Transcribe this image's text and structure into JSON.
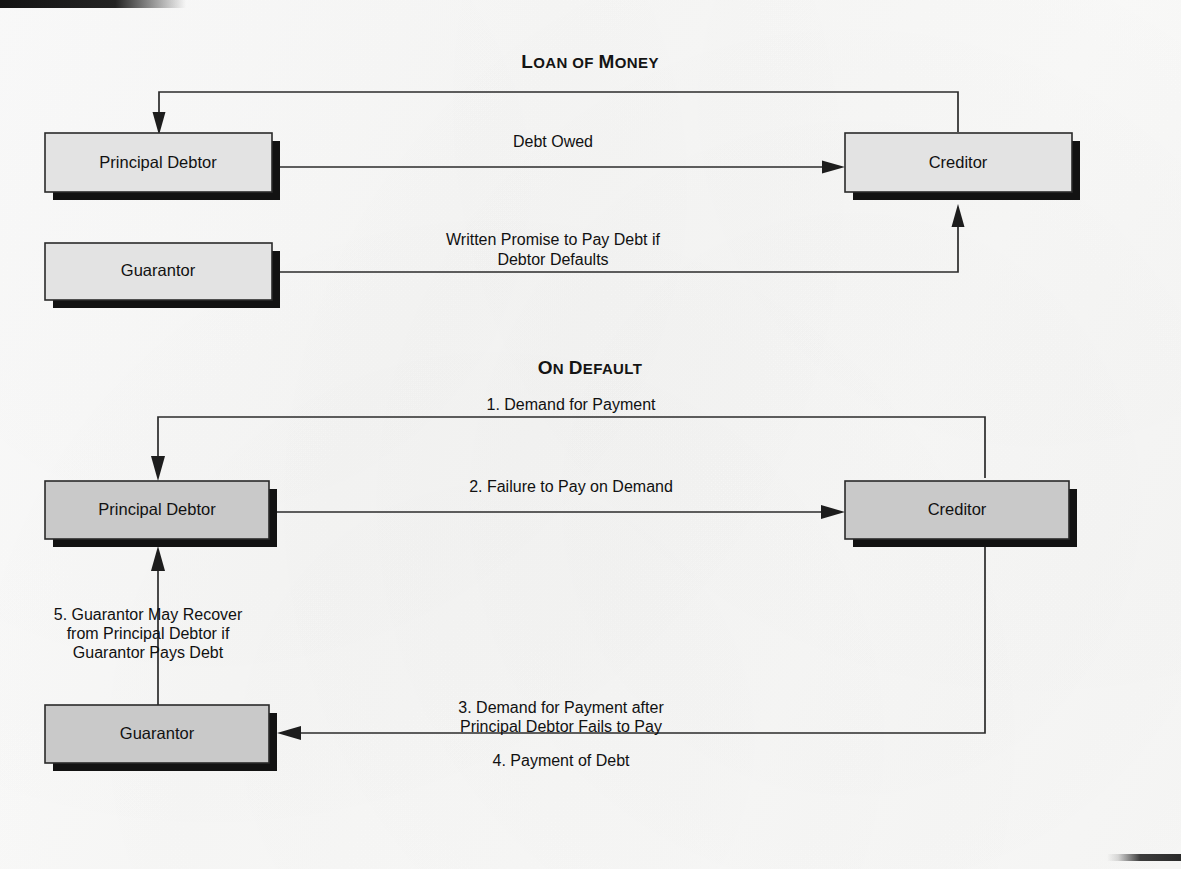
{
  "page": {
    "background_color": "#f8f8f7",
    "ink_color": "#1a1a1a"
  },
  "colors": {
    "box_fill_top": "#e3e3e3",
    "box_fill_lower": "#c9c9c9",
    "box_border": "#2a2a2a",
    "box_shadow": "#121212",
    "line": "#2b2b2b"
  },
  "sections": [
    {
      "id": "loan-of-money",
      "heading": "Loan of Money",
      "heading_first_letters": [
        "L",
        "M"
      ],
      "heading_parts": [
        {
          "text": "L",
          "size": "cap"
        },
        {
          "text": "OAN",
          "size": "small"
        },
        {
          "text": " OF ",
          "size": "small"
        },
        {
          "text": "M",
          "size": "cap"
        },
        {
          "text": "ONEY",
          "size": "small"
        }
      ],
      "nodes": [
        {
          "id": "top-principal-debtor",
          "label": "Principal Debtor"
        },
        {
          "id": "top-creditor",
          "label": "Creditor"
        },
        {
          "id": "top-guarantor",
          "label": "Guarantor"
        }
      ],
      "edges": [
        {
          "id": "loan-of-money-edge",
          "label_lines": [
            "Loan of Money"
          ],
          "from": "top-creditor",
          "to": "top-principal-debtor",
          "note": "routed above boxes, unlabeled on line"
        },
        {
          "id": "debt-owed-edge",
          "label_lines": [
            "Debt Owed"
          ],
          "from": "top-principal-debtor",
          "to": "top-creditor"
        },
        {
          "id": "written-promise-edge",
          "label_lines": [
            "Written Promise to Pay Debt if",
            "Debtor Defaults"
          ],
          "from": "top-guarantor",
          "to": "top-creditor"
        }
      ]
    },
    {
      "id": "on-default",
      "heading": "On Default",
      "heading_parts": [
        {
          "text": "O",
          "size": "cap"
        },
        {
          "text": "N",
          "size": "small"
        },
        {
          "text": " ",
          "size": "small"
        },
        {
          "text": "D",
          "size": "cap"
        },
        {
          "text": "EFAULT",
          "size": "small"
        }
      ],
      "nodes": [
        {
          "id": "bottom-principal-debtor",
          "label": "Principal Debtor"
        },
        {
          "id": "bottom-creditor",
          "label": "Creditor"
        },
        {
          "id": "bottom-guarantor",
          "label": "Guarantor"
        }
      ],
      "edges": [
        {
          "id": "demand-for-payment-edge",
          "label_lines": [
            "1. Demand for Payment"
          ],
          "from": "bottom-creditor",
          "to": "bottom-principal-debtor"
        },
        {
          "id": "failure-to-pay-edge",
          "label_lines": [
            "2. Failure to Pay on Demand"
          ],
          "from": "bottom-principal-debtor",
          "to": "bottom-creditor"
        },
        {
          "id": "demand-after-failure-edge",
          "label_lines": [
            "3. Demand for Payment after",
            "Principal Debtor Fails to Pay"
          ],
          "from": "bottom-creditor",
          "to": "bottom-guarantor"
        },
        {
          "id": "payment-of-debt-edge",
          "label_lines": [
            "4. Payment of Debt"
          ],
          "from": "bottom-guarantor",
          "to": "bottom-creditor"
        },
        {
          "id": "guarantor-recovery-edge",
          "label_lines": [
            "5. Guarantor May Recover",
            "from Principal Debtor if",
            "Guarantor Pays Debt"
          ],
          "from": "bottom-guarantor",
          "to": "bottom-principal-debtor"
        }
      ]
    }
  ],
  "labels": {
    "top_principal_debtor": "Principal Debtor",
    "top_creditor": "Creditor",
    "top_guarantor": "Guarantor",
    "bottom_principal_debtor": "Principal Debtor",
    "bottom_creditor": "Creditor",
    "bottom_guarantor": "Guarantor",
    "debt_owed": "Debt Owed",
    "written_promise_l1": "Written Promise to Pay Debt if",
    "written_promise_l2": "Debtor Defaults",
    "demand_for_payment": "1. Demand for Payment",
    "failure_to_pay": "2. Failure to Pay on Demand",
    "demand_after_l1": "3. Demand for Payment after",
    "demand_after_l2": "Principal Debtor Fails to Pay",
    "payment_of_debt": "4. Payment of Debt",
    "recover_l1": "5. Guarantor May Recover",
    "recover_l2": "from Principal Debtor if",
    "recover_l3": "Guarantor Pays Debt"
  },
  "headings": {
    "loan_of_money": {
      "cap1": "L",
      "rest1": "OAN",
      "mid": " OF ",
      "cap2": "M",
      "rest2": "ONEY"
    },
    "on_default": {
      "cap1": "O",
      "rest1": "N",
      "mid": " ",
      "cap2": "D",
      "rest2": "EFAULT"
    }
  }
}
